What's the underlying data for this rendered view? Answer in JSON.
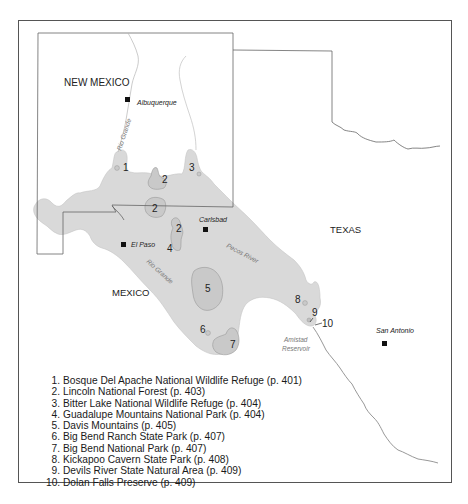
{
  "map": {
    "colors": {
      "region_fill": "#d9d9d9",
      "site_fill": "#c9c9c9",
      "border": "#555555",
      "river": "#8c8c8c",
      "city_marker": "#111111",
      "background": "#ffffff"
    },
    "regions": {
      "new_mexico": "NEW MEXICO",
      "texas": "TEXAS",
      "mexico": "MEXICO"
    },
    "cities": [
      {
        "name": "Albuquerque",
        "marker": "square"
      },
      {
        "name": "Carlsbad",
        "marker": "square"
      },
      {
        "name": "El Paso",
        "marker": "square"
      },
      {
        "name": "San Antonio",
        "marker": "square"
      }
    ],
    "water_labels": {
      "rio_grande_north": "Rio Grande",
      "rio_grande_south": "Rio Grande",
      "pecos_river": "Pecos River",
      "amistad_line1": "Amistad",
      "amistad_line2": "Reservoir"
    },
    "site_markers": [
      "1",
      "2",
      "2",
      "2",
      "3",
      "4",
      "5",
      "6",
      "7",
      "8",
      "9",
      "10"
    ]
  },
  "legend": {
    "items": [
      {
        "num": "1.",
        "label": "Bosque Del Apache National Wildlife Refuge (p. 401)"
      },
      {
        "num": "2.",
        "label": "Lincoln National Forest (p. 403)"
      },
      {
        "num": "3.",
        "label": "Bitter Lake National Wildlife Refuge (p. 404)"
      },
      {
        "num": "4.",
        "label": "Guadalupe Mountains National Park (p. 404)"
      },
      {
        "num": "5.",
        "label": "Davis Mountains (p. 405)"
      },
      {
        "num": "6.",
        "label": "Big Bend Ranch State Park (p. 407)"
      },
      {
        "num": "7.",
        "label": "Big Bend National Park (p. 407)"
      },
      {
        "num": "8.",
        "label": "Kickapoo Cavern State Park (p. 408)"
      },
      {
        "num": "9.",
        "label": "Devils River State Natural Area (p. 409)"
      },
      {
        "num": "10.",
        "label": "Dolan Falls Preserve (p. 409)"
      }
    ]
  }
}
